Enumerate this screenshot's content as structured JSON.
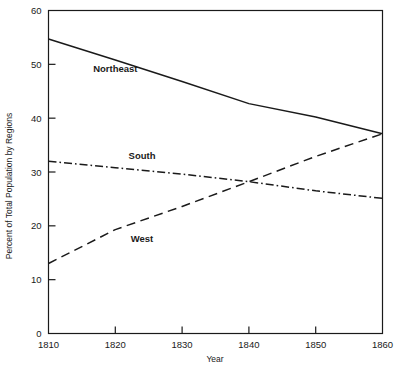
{
  "chart_data": {
    "type": "line",
    "title": "",
    "xlabel": "Year",
    "ylabel": "Percent of Total Population by Regions",
    "xlim": [
      1810,
      1860
    ],
    "ylim": [
      0,
      60
    ],
    "xticks": [
      1810,
      1820,
      1830,
      1840,
      1850,
      1860
    ],
    "yticks": [
      0,
      10,
      20,
      30,
      40,
      50,
      60
    ],
    "grid": false,
    "legend_position": "inline-annotations",
    "x": [
      1810,
      1820,
      1830,
      1840,
      1850,
      1860
    ],
    "series": [
      {
        "name": "Northeast",
        "style": "solid",
        "values": [
          54.7,
          50.8,
          46.8,
          42.7,
          40.2,
          37.1
        ],
        "label_x": 1820,
        "label_y": 48.5
      },
      {
        "name": "South",
        "style": "dash-dot",
        "values": [
          32.0,
          30.8,
          29.6,
          28.2,
          26.5,
          25.1
        ],
        "label_x": 1824,
        "label_y": 32.5
      },
      {
        "name": "West",
        "style": "dashed",
        "values": [
          13.0,
          19.3,
          23.6,
          28.2,
          32.9,
          37.1
        ],
        "label_x": 1824,
        "label_y": 17.0
      }
    ],
    "colors": {
      "axis": "#1a1a1a",
      "line": "#1a1a1a",
      "background": "#ffffff"
    }
  },
  "axis_labels": {
    "x_title": "Year",
    "y_title": "Percent of Total Population by Regions",
    "x_ticks": [
      "1810",
      "1820",
      "1830",
      "1840",
      "1850",
      "1860"
    ],
    "y_ticks": [
      "0",
      "10",
      "20",
      "30",
      "40",
      "50",
      "60"
    ]
  },
  "series_names": {
    "northeast": "Northeast",
    "south": "South",
    "west": "West"
  }
}
